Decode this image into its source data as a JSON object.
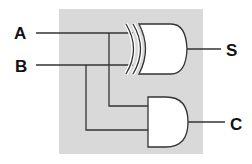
{
  "diagram": {
    "inputs": [
      {
        "label": "A"
      },
      {
        "label": "B"
      }
    ],
    "outputs": [
      {
        "label": "S",
        "source": "XOR"
      },
      {
        "label": "C",
        "source": "AND"
      }
    ],
    "gates": [
      {
        "type": "XOR",
        "inputs": [
          "A",
          "B"
        ],
        "output": "S"
      },
      {
        "type": "AND",
        "inputs": [
          "A",
          "B"
        ],
        "output": "C"
      }
    ],
    "colors": {
      "background_panel": "#d9d9d9",
      "wire": "#333333",
      "gate_fill": "#ffffff",
      "text": "#111111"
    }
  }
}
